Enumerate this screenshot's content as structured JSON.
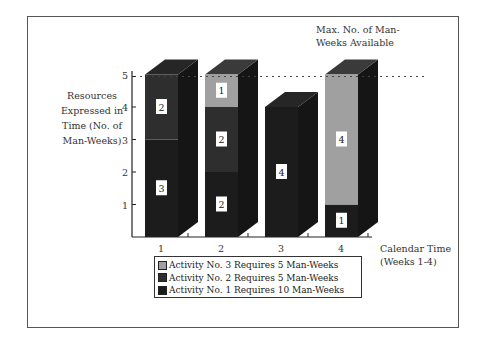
{
  "chart_data": {
    "type": "bar",
    "stacked": true,
    "three_d": true,
    "categories": [
      "1",
      "2",
      "3",
      "4"
    ],
    "series": [
      {
        "name": "Activity No. 1 Requires 10 Man-Weeks",
        "values": [
          3,
          2,
          4,
          1
        ],
        "color": "#1c1c1c"
      },
      {
        "name": "Activity No. 2 Requires 5 Man-Weeks",
        "values": [
          2,
          2,
          0,
          0
        ],
        "color": "#2e2e2e"
      },
      {
        "name": "Activity No. 3 Requires 5 Man-Weeks",
        "values": [
          0,
          1,
          0,
          4
        ],
        "color": "#a0a0a0"
      }
    ],
    "bar_labels": [
      [
        "3",
        "2"
      ],
      [
        "2",
        "2",
        "1"
      ],
      [
        "4"
      ],
      [
        "1",
        "4"
      ]
    ],
    "week3_top_label": "1",
    "ylabel": "Resources Expressed in Time (No. of Man-Weeks)",
    "xlabel": "Calendar Time (Weeks 1-4)",
    "yticks": [
      1,
      2,
      3,
      4,
      5
    ],
    "ylim": [
      0,
      5
    ],
    "annotation": "Max. No. of Man-Weeks Available",
    "max_line": 5,
    "legend_position": "bottom"
  },
  "labels": {
    "annotation_line1": "Max. No. of Man-",
    "annotation_line2": "Weeks Available",
    "ylabel_l1": "Resources",
    "ylabel_l2": "Expressed in",
    "ylabel_l3": "Time (No. of",
    "ylabel_l4": "Man-Weeks)",
    "xlabel_l1": "Calendar Time",
    "xlabel_l2": "(Weeks 1-4)",
    "legend": [
      "Activity No. 3 Requires 5 Man-Weeks",
      "Activity No. 2 Requires 5 Man-Weeks",
      "Activity No. 1 Requires 10 Man-Weeks"
    ],
    "legend_colors": [
      "#a0a0a0",
      "#2e2e2e",
      "#1c1c1c"
    ]
  }
}
